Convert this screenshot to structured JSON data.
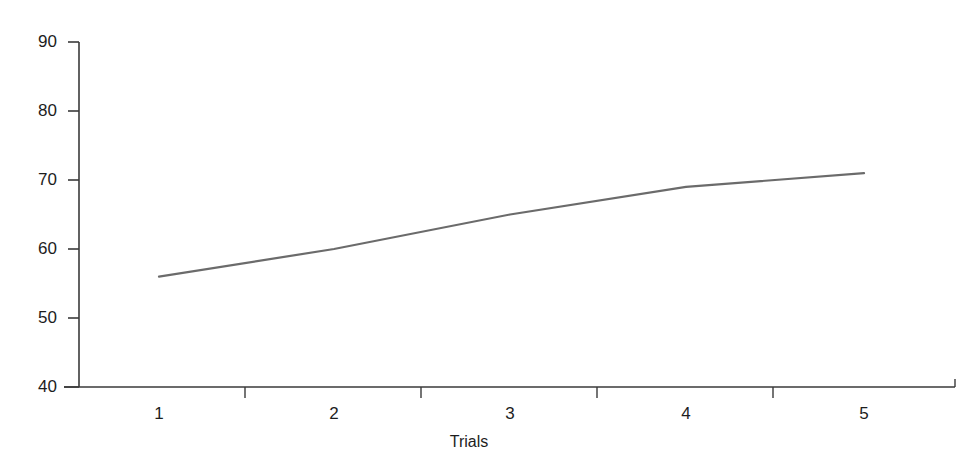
{
  "chart_data": {
    "type": "line",
    "title": "",
    "subtitle": "",
    "xlabel": "Trials",
    "ylabel": "",
    "categories": [
      "1",
      "2",
      "3",
      "4",
      "5"
    ],
    "x": [
      1,
      2,
      3,
      4,
      5
    ],
    "values": [
      56,
      60,
      65,
      69,
      71
    ],
    "series": [
      {
        "name": "",
        "values": [
          56,
          60,
          65,
          69,
          71
        ]
      }
    ],
    "ylim": [
      40,
      90
    ],
    "yticks": [
      40,
      50,
      60,
      70,
      80,
      90
    ],
    "ytick_labels": [
      "40",
      "50",
      "60",
      "70",
      "80",
      "90"
    ],
    "xtick_labels": [
      "1",
      "2",
      "3",
      "4",
      "5"
    ],
    "grid": false,
    "legend": false,
    "legend_position": "none",
    "annotations": [],
    "line_color": "#6b6b6b",
    "axis_color": "#3a3a3a",
    "background_color": "#ffffff",
    "text_color": "#1d1d1d"
  },
  "axes": {
    "y_tick_labels": [
      "90",
      "80",
      "70",
      "60",
      "50",
      "40"
    ],
    "x_tick_labels": [
      "1",
      "2",
      "3",
      "4",
      "5"
    ],
    "x_axis_title": "Trials"
  }
}
